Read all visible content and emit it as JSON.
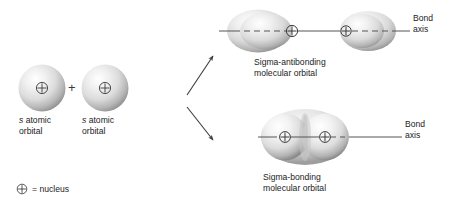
{
  "figure": {
    "colors": {
      "orbital_fill_light": "#ffffff",
      "orbital_fill_mid": "#d9d9d9",
      "orbital_fill_edge": "#8f8f8f",
      "line": "#555555",
      "text": "#1c1c1c",
      "background": "#ffffff"
    }
  },
  "reactants": {
    "left_orbital": {
      "label_italic": "s",
      "label_line1": " atomic",
      "label_line2": "orbital",
      "nucleus_symbol": "⊕"
    },
    "operator": "+",
    "right_orbital": {
      "label_italic": "s",
      "label_line1": " atomic",
      "label_line2": "orbital",
      "nucleus_symbol": "⊕"
    }
  },
  "legend": {
    "nucleus_symbol": "⊕",
    "text": "= nucleus"
  },
  "products": {
    "antibonding": {
      "caption_line1": "Sigma-antibonding",
      "caption_line2": "molecular orbital",
      "axis_label_line1": "Bond",
      "axis_label_line2": "axis",
      "nucleus_symbol": "⊕",
      "nuclei_count": 2
    },
    "bonding": {
      "caption_line1": "Sigma-bonding",
      "caption_line2": "molecular orbital",
      "axis_label_line1": "Bond",
      "axis_label_line2": "axis",
      "nucleus_symbol": "⊕",
      "nuclei_count": 2
    }
  },
  "arrows": {
    "to_antibonding": "arrow-up-right",
    "to_bonding": "arrow-down-right"
  }
}
